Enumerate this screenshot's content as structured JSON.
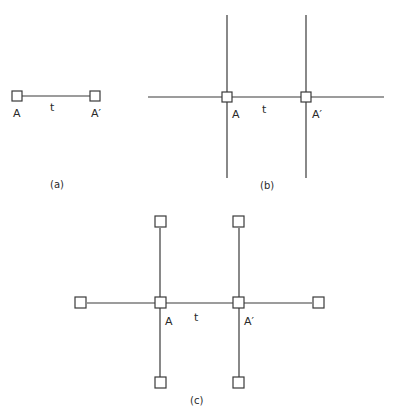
{
  "diagram": {
    "panels": [
      {
        "id": "a",
        "caption": "(a)",
        "labels": {
          "left_node": "A",
          "bond": "t",
          "right_node": "A′"
        },
        "description": "Two sites A and A′ connected by hopping t"
      },
      {
        "id": "b",
        "caption": "(b)",
        "labels": {
          "left_node": "A",
          "bond": "t",
          "right_node": "A′"
        },
        "description": "Two sites A and A′ connected by t, each embedded in infinite lines (vertical and horizontal)"
      },
      {
        "id": "c",
        "caption": "(c)",
        "labels": {
          "left_node": "A",
          "bond": "t",
          "right_node": "A′"
        },
        "description": "Two sites A and A′ connected by t, each with three additional nearest-neighbor sites (Bethe-lattice-like cluster)"
      }
    ],
    "colors": {
      "line": "#3a3a3a",
      "background": "#ffffff",
      "text": "#2a2a2a"
    }
  }
}
